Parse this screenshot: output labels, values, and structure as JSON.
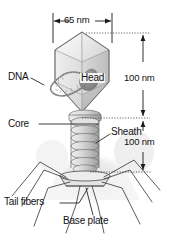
{
  "figure": {
    "background_color": "#ffffff",
    "line_color": "#1a1a1a"
  },
  "dimensions": {
    "head_width": "65 nm",
    "head_height": "100 nm",
    "tail_height": "100 nm"
  },
  "labels": {
    "dna": "DNA",
    "head": "Head",
    "core": "Core",
    "sheath": "Sheath",
    "tail_fibers": "Tail fibers",
    "base_plate": "Base plate"
  },
  "palette": {
    "head_light": "#f4f4f4",
    "head_mid": "#e2e2e2",
    "head_dark": "#c9c9c9",
    "head_shade": "#b4b4b4",
    "sheath_light": "#e6e6e6",
    "sheath_mid": "#cfcfcf",
    "sheath_dark": "#a9a9a9",
    "dna_blob": "#8e8e8e",
    "haze": "#ebebeb",
    "outline": "#2b2b2b"
  }
}
